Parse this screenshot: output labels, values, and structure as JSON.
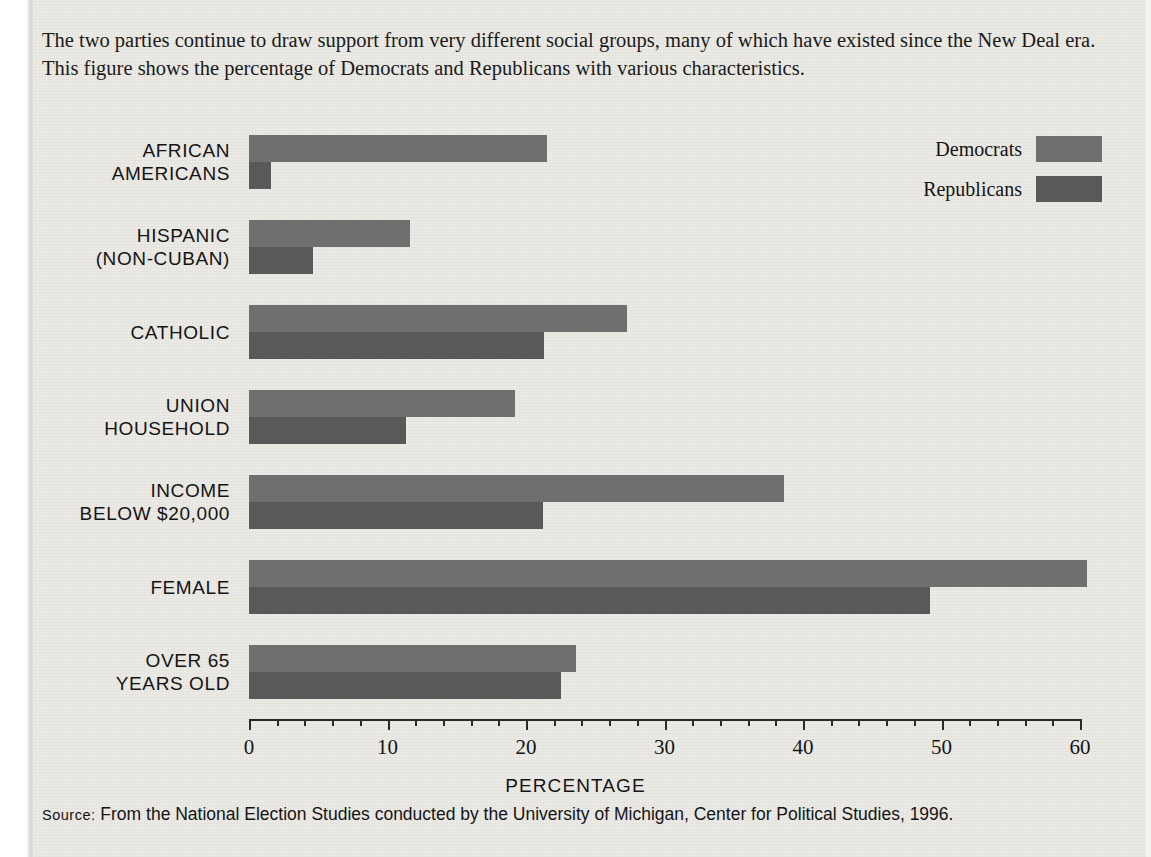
{
  "caption": "The two parties continue to draw support from very different social groups, many of which have existed since the New Deal era. This figure shows the percentage of Democrats and Republicans with various characteristics.",
  "source": {
    "label": "Source:",
    "text": " From the National Election Studies conducted by the University of Michigan, Center for Political Studies, 1996."
  },
  "legend": {
    "items": [
      {
        "label": "Democrats",
        "color": "#6f6f6f"
      },
      {
        "label": "Republicans",
        "color": "#595959"
      }
    ]
  },
  "chart_data": {
    "type": "bar",
    "orientation": "horizontal",
    "title": "",
    "xlabel": "PERCENTAGE",
    "ylabel": "",
    "xlim": [
      0,
      60
    ],
    "xticks": [
      0,
      10,
      20,
      30,
      40,
      50,
      60
    ],
    "xtick_labels": [
      "0",
      "10",
      "20",
      "30",
      "40",
      "50",
      "60"
    ],
    "minor_tick_step": 2,
    "grid": false,
    "legend_position": "top-right",
    "categories": [
      "AFRICAN AMERICANS",
      "HISPANIC (NON-CUBAN)",
      "CATHOLIC",
      "UNION HOUSEHOLD",
      "INCOME BELOW $20,000",
      "FEMALE",
      "OVER 65 YEARS OLD"
    ],
    "category_lines": [
      [
        "AFRICAN",
        "AMERICANS"
      ],
      [
        "HISPANIC",
        "(NON-CUBAN)"
      ],
      [
        "CATHOLIC"
      ],
      [
        "UNION",
        "HOUSEHOLD"
      ],
      [
        "INCOME",
        "BELOW $20,000"
      ],
      [
        "FEMALE"
      ],
      [
        "OVER 65",
        "YEARS OLD"
      ]
    ],
    "series": [
      {
        "name": "Democrats",
        "color": "#6f6f6f",
        "values": [
          21.5,
          11.6,
          27.3,
          19.2,
          38.6,
          60.5,
          23.6
        ]
      },
      {
        "name": "Republicans",
        "color": "#595959",
        "values": [
          1.6,
          4.6,
          21.3,
          11.3,
          21.2,
          49.2,
          22.5
        ]
      }
    ]
  }
}
